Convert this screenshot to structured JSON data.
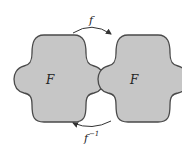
{
  "diagram": {
    "left_shape_label": "F",
    "right_shape_label": "F",
    "top_arrow_label": "f",
    "bottom_arrow_label": "f",
    "bottom_arrow_superscript": "−1",
    "colors": {
      "shape_fill": "#c6c6c6",
      "shape_stroke": "#4a4a4a",
      "arrow": "#333333"
    }
  }
}
